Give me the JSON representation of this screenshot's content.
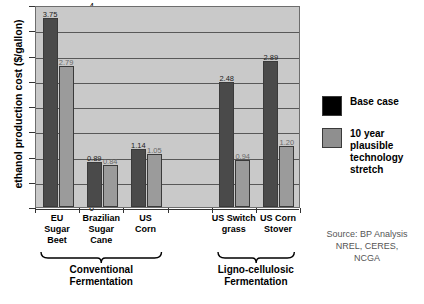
{
  "chart_data": {
    "type": "bar",
    "title": "",
    "xlabel": "",
    "ylabel": "ethanol production cost ($/gallon)",
    "ylim": [
      0,
      4
    ],
    "ytick_step": 0.5,
    "yticks": [
      "0",
      "0.5",
      "1",
      "1.5",
      "2",
      "2.5",
      "3",
      "3.5",
      "4"
    ],
    "grid": true,
    "legend_position": "right",
    "categories": [
      "EU Sugar Beet",
      "Brazilian Sugar Cane",
      "US Corn",
      "US Switchgrass",
      "US Corn Stover"
    ],
    "series": [
      {
        "name": "Base case",
        "color": "#4a4a4a",
        "values": [
          3.75,
          0.89,
          1.14,
          2.48,
          2.89
        ],
        "labels": [
          "3.75",
          "0.89",
          "1.14",
          "2.48",
          "2.89"
        ]
      },
      {
        "name": "10 year plausible technology stretch",
        "color": "#9b9b9b",
        "values": [
          2.79,
          0.84,
          1.05,
          0.94,
          1.2
        ],
        "labels": [
          "2.79",
          "0.84",
          "1.05",
          "0.94",
          "1.20"
        ]
      }
    ],
    "annotations": [
      "Conventional Fermentation",
      "Ligno-cellulosic Fermentation"
    ],
    "source": "Source: BP Analysis NREL, CERES, NCGA"
  },
  "axis": {
    "y_title": "ethanol production cost ($/gallon)",
    "ticks": [
      {
        "label": "4",
        "value": 4.0
      },
      {
        "label": "3.5",
        "value": 3.5
      },
      {
        "label": "3",
        "value": 3.0
      },
      {
        "label": "2.5",
        "value": 2.5
      },
      {
        "label": "2",
        "value": 2.0
      },
      {
        "label": "1.5",
        "value": 1.5
      },
      {
        "label": "1",
        "value": 1.0
      },
      {
        "label": "0.5",
        "value": 0.5
      },
      {
        "label": "0",
        "value": 0.0
      }
    ]
  },
  "categories": [
    {
      "id": "eu-sugar-beet",
      "lines": [
        "EU",
        "Sugar",
        "Beet"
      ]
    },
    {
      "id": "brazilian-sugar-cane",
      "lines": [
        "Brazilian",
        "Sugar",
        "Cane"
      ]
    },
    {
      "id": "us-corn",
      "lines": [
        "US",
        "Corn"
      ]
    },
    {
      "id": "us-switchgrass",
      "lines": [
        "US Switch",
        "grass"
      ]
    },
    {
      "id": "us-corn-stover",
      "lines": [
        "US Corn",
        "Stover"
      ]
    }
  ],
  "groups": [
    {
      "id": "conventional",
      "lines": [
        "Conventional",
        "Fermentation"
      ]
    },
    {
      "id": "ligno-cellulosic",
      "lines": [
        "Ligno-cellulosic",
        "Fermentation"
      ]
    }
  ],
  "legend": {
    "items": [
      {
        "id": "base-case",
        "label": "Base case",
        "color": "#000000"
      },
      {
        "id": "ten-year-stretch",
        "label": "10 year plausible technology stretch",
        "lines": [
          "10 year",
          "plausible",
          "technology",
          "stretch"
        ],
        "color": "#8f8f8f"
      }
    ]
  },
  "source": {
    "lines": [
      "Source: BP Analysis",
      "NREL, CERES,",
      "NCGA"
    ]
  }
}
